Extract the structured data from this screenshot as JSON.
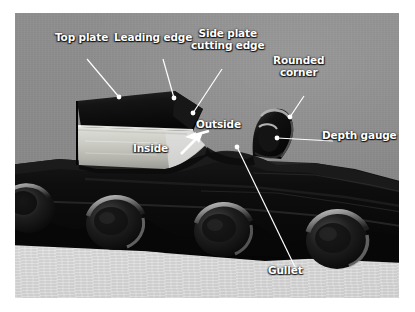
{
  "figure": {
    "kind": "annotated-photograph",
    "colors": {
      "page_background": "#ffffff",
      "photo_backdrop": "#8a8a8a",
      "table_surface": "#d8d8d8",
      "chain_dark": "#0d0d0d",
      "chrome_highlight": "#e8e8e4",
      "label_text": "#ffffff",
      "leader_line": "#ffffff"
    },
    "frame": {
      "x": 15,
      "y": 13,
      "width": 384,
      "height": 285
    }
  },
  "labels": [
    {
      "id": "top-plate",
      "text": "Top plate",
      "lines": [
        "Top plate"
      ],
      "x": 55,
      "y": 32,
      "leader": {
        "type": "line-dot",
        "from": [
          72,
          46
        ],
        "to": [
          104,
          84
        ]
      }
    },
    {
      "id": "leading-edge",
      "text": "Leading edge",
      "lines": [
        "Leading edge"
      ],
      "x": 114,
      "y": 32,
      "leader": {
        "type": "line-dot",
        "from": [
          148,
          46
        ],
        "to": [
          159,
          85
        ]
      }
    },
    {
      "id": "side-plate-cutting-edge",
      "text": "Side plate cutting edge",
      "lines": [
        "Side plate",
        "cutting edge"
      ],
      "x": 191,
      "y": 28,
      "leader": {
        "type": "line-dot",
        "from": [
          207,
          56
        ],
        "to": [
          178,
          100
        ]
      }
    },
    {
      "id": "rounded-corner",
      "text": "Rounded corner",
      "lines": [
        "Rounded",
        "corner"
      ],
      "x": 273,
      "y": 55,
      "leader": {
        "type": "line-dot",
        "from": [
          289,
          83
        ],
        "to": [
          275,
          104
        ]
      }
    },
    {
      "id": "depth-gauge",
      "text": "Depth gauge",
      "lines": [
        "Depth gauge"
      ],
      "x": 322,
      "y": 123,
      "leader": {
        "type": "line-dot",
        "from": [
          318,
          128
        ],
        "to": [
          262,
          125
        ]
      }
    },
    {
      "id": "outside",
      "text": "Outside",
      "lines": [
        "Outside"
      ],
      "x": 196,
      "y": 112,
      "leader": {
        "type": "arrow",
        "from": [
          194,
          118
        ],
        "to": [
          174,
          124
        ]
      }
    },
    {
      "id": "inside",
      "text": "Inside",
      "lines": [
        "Inside"
      ],
      "x": 133,
      "y": 136,
      "leader": {
        "type": "arrow",
        "from": [
          164,
          141
        ],
        "to": [
          186,
          120
        ]
      }
    },
    {
      "id": "gullet",
      "text": "Gullet",
      "lines": [
        "Gullet"
      ],
      "x": 268,
      "y": 258,
      "leader": {
        "type": "line-dot",
        "from": [
          281,
          256
        ],
        "to": [
          222,
          134
        ]
      }
    }
  ]
}
